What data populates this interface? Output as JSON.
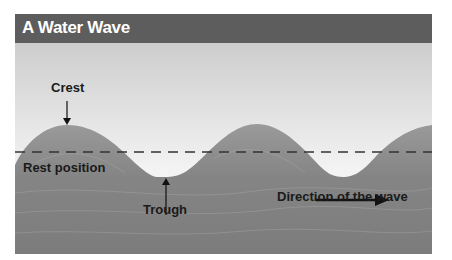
{
  "diagram": {
    "title": "A Water Wave",
    "labels": {
      "crest": "Crest",
      "rest_position": "Rest position",
      "trough": "Trough",
      "direction": "Direction of the wave"
    },
    "colors": {
      "title_bar": "#5d5d5d",
      "title_text": "#ffffff",
      "sky_top": "#cfcfcf",
      "sky_bottom": "#f7f7f7",
      "water": "#8a8a8a",
      "label_text": "#1a1a1a"
    }
  }
}
